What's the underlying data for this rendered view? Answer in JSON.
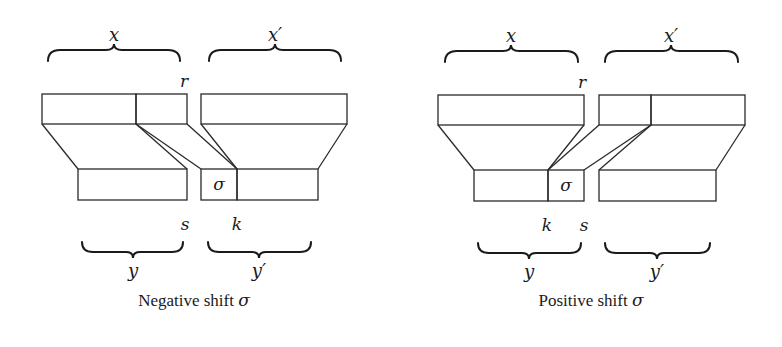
{
  "figure": {
    "panels": [
      {
        "id": "negative",
        "caption_text": "Negative shift",
        "caption_symbol": "σ",
        "labels": {
          "x": "x",
          "x_prime": "x′",
          "r": "r",
          "s": "s",
          "k": "k",
          "y": "y",
          "y_prime": "y′",
          "sigma_box": "σ"
        }
      },
      {
        "id": "positive",
        "caption_text": "Positive shift",
        "caption_symbol": "σ",
        "labels": {
          "x": "x",
          "x_prime": "x′",
          "r": "r",
          "s": "s",
          "k": "k",
          "y": "y",
          "y_prime": "y′",
          "sigma_box": "σ"
        }
      }
    ],
    "colors": {
      "background": "#ffffff",
      "stroke": "#2a2a2a",
      "text": "#1a1a1a"
    }
  }
}
